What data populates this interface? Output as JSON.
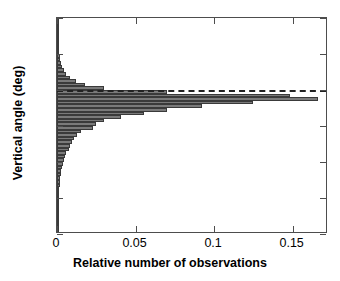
{
  "chart_data": {
    "type": "bar",
    "orientation": "horizontal",
    "title": "",
    "xlabel": "Relative number of observations",
    "ylabel": "Vertical angle (deg)",
    "xlim": [
      0,
      0.1725
    ],
    "ylim": [
      -40,
      20
    ],
    "xticks": [
      0,
      0.05,
      0.1,
      0.15
    ],
    "xticklabels": [
      "0",
      "0.05",
      "0.1",
      "0.15"
    ],
    "yticks": [
      20,
      10,
      0,
      -10,
      -20,
      -30,
      -40
    ],
    "yticklabels": [
      "20",
      "10",
      "0",
      "-10",
      "-20",
      "-30",
      "-40"
    ],
    "grid": false,
    "legend": null,
    "bin_width": 1,
    "bar_color": "#7a7a7a",
    "bar_edge_color": "#3a3a3a",
    "annotations": [
      {
        "type": "dashed-horizontal-line",
        "y": 0,
        "color": "#222222",
        "label": ""
      }
    ],
    "categories": [
      19.5,
      18.5,
      17.5,
      16.5,
      15.5,
      14.5,
      13.5,
      12.5,
      11.5,
      10.5,
      9.5,
      8.5,
      7.5,
      6.5,
      5.5,
      4.5,
      3.5,
      2.5,
      1.5,
      0.5,
      -0.5,
      -1.5,
      -2.5,
      -3.5,
      -4.5,
      -5.5,
      -6.5,
      -7.5,
      -8.5,
      -9.5,
      -10.5,
      -11.5,
      -12.5,
      -13.5,
      -14.5,
      -15.5,
      -16.5,
      -17.5,
      -18.5,
      -19.5,
      -20.5,
      -21.5,
      -22.5,
      -23.5,
      -24.5,
      -25.5,
      -26.5,
      -27.5,
      -28.5,
      -29.5,
      -30.5,
      -31.5,
      -32.5,
      -33.5,
      -34.5,
      -35.5,
      -36.5,
      -37.5,
      -38.5,
      -39.5
    ],
    "values": [
      0.0005,
      0.0005,
      0.0006,
      0.0006,
      0.0007,
      0.0008,
      0.0009,
      0.001,
      0.0012,
      0.0014,
      0.0018,
      0.0022,
      0.0028,
      0.0035,
      0.0045,
      0.006,
      0.0085,
      0.012,
      0.018,
      0.03,
      0.07,
      0.148,
      0.166,
      0.125,
      0.092,
      0.07,
      0.0555,
      0.041,
      0.03,
      0.025,
      0.023,
      0.015,
      0.013,
      0.011,
      0.0095,
      0.0085,
      0.0075,
      0.006,
      0.005,
      0.0045,
      0.004,
      0.0035,
      0.0028,
      0.0024,
      0.002,
      0.0018,
      0.0016,
      0.0014,
      0.0012,
      0.0011,
      0.001,
      0.0009,
      0.0008,
      0.0008,
      0.0007,
      0.0007,
      0.0006,
      0.0006,
      0.0005,
      0.0005
    ]
  }
}
